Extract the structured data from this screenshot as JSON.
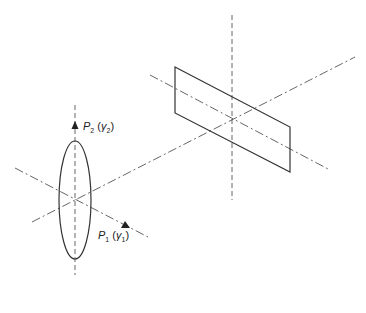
{
  "diagram": {
    "type": "polarizer-analyzer schematic",
    "colors": {
      "line": "#333333",
      "dash": "#555555",
      "background": "#ffffff"
    },
    "source": {
      "shape": "ellipse",
      "center": [
        75,
        200
      ],
      "rx": 16,
      "ry": 59
    },
    "plate": {
      "shape": "parallelogram",
      "corners": [
        [
          175,
          67
        ],
        [
          290,
          127
        ],
        [
          290,
          172
        ],
        [
          175,
          113
        ]
      ],
      "center": [
        232,
        118
      ]
    },
    "axes": {
      "optical_axis": {
        "from": [
          32,
          222
        ],
        "to": [
          355,
          57
        ],
        "style": "dash-dot"
      },
      "p1_axis": {
        "from": [
          15,
          168
        ],
        "to": [
          148,
          237
        ],
        "style": "dash-dot"
      },
      "left_vertical": {
        "from": [
          75,
          105
        ],
        "to": [
          75,
          275
        ],
        "style": "dashed"
      },
      "plate_vertical": {
        "from": [
          232,
          15
        ],
        "to": [
          232,
          200
        ],
        "style": "dashed"
      },
      "plate_cross": {
        "from": [
          150,
          75
        ],
        "to": [
          330,
          170
        ],
        "style": "dash-dot"
      }
    },
    "labels": {
      "p2": {
        "main": "P",
        "sub": "2",
        "paren_open": " (",
        "gamma": "γ",
        "gamma_sub": "2",
        "paren_close": ")"
      },
      "p1": {
        "main": "P",
        "sub": "1",
        "paren_open": " (",
        "gamma": "γ",
        "gamma_sub": "1",
        "paren_close": ")"
      }
    },
    "arrows": {
      "p2_arrow": {
        "tip": [
          75,
          121
        ]
      },
      "p1_arrow": {
        "tip": [
          128,
          227
        ]
      }
    }
  }
}
